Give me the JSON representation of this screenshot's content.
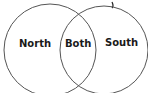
{
  "diagram": {
    "type": "venn",
    "title_fragment": "g",
    "sets": [
      {
        "id": "left",
        "label": "North"
      },
      {
        "id": "right",
        "label": "South"
      }
    ],
    "intersection": {
      "label": "Both"
    },
    "colors": {
      "stroke": "#555555",
      "text": "#1a1a1a",
      "background": "#ffffff"
    }
  }
}
